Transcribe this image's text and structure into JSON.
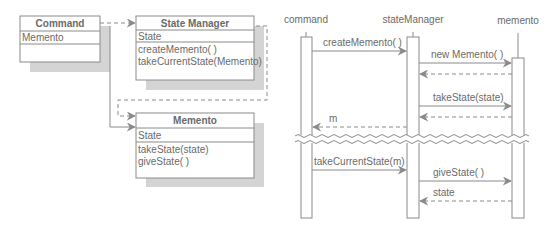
{
  "class_diagram": {
    "classes": [
      {
        "name": "Command",
        "attributes": [
          "Memento"
        ],
        "methods": []
      },
      {
        "name": "State Manager",
        "attributes": [
          "State"
        ],
        "methods": [
          "createMemento( )",
          "takeCurrentState(Memento)"
        ]
      },
      {
        "name": "Memento",
        "attributes": [
          "State"
        ],
        "methods": [
          "takeState(state)",
          "giveState( )"
        ]
      }
    ],
    "relations": [
      {
        "from": "Command",
        "to": "State Manager",
        "style": "dashed"
      },
      {
        "from": "Command",
        "to": "Memento",
        "style": "solid"
      },
      {
        "from": "State Manager",
        "to": "Memento",
        "style": "dashed"
      }
    ]
  },
  "sequence_diagram": {
    "participants": [
      "command",
      "stateManager",
      "memento"
    ],
    "messages": [
      {
        "from": "command",
        "to": "stateManager",
        "label": "createMemento( )",
        "style": "solid"
      },
      {
        "from": "stateManager",
        "to": "memento",
        "label": "new Memento( )",
        "style": "solid"
      },
      {
        "from": "memento",
        "to": "stateManager",
        "label": "",
        "style": "dashed"
      },
      {
        "from": "stateManager",
        "to": "memento",
        "label": "takeState(state)",
        "style": "solid"
      },
      {
        "from": "memento",
        "to": "stateManager",
        "label": "",
        "style": "dashed"
      },
      {
        "from": "stateManager",
        "to": "command",
        "label": "m",
        "style": "dashed"
      },
      {
        "from": "command",
        "to": "stateManager",
        "label": "takeCurrentState(m)",
        "style": "solid"
      },
      {
        "from": "stateManager",
        "to": "memento",
        "label": "giveState( )",
        "style": "solid"
      },
      {
        "from": "memento",
        "to": "stateManager",
        "label": "state",
        "style": "dashed"
      }
    ],
    "time_break": true
  },
  "colors": {
    "line": "#8a8a8a",
    "text": "#6a6a6a",
    "shadow": "#d4d4d4",
    "box_fill": "#ffffff"
  }
}
